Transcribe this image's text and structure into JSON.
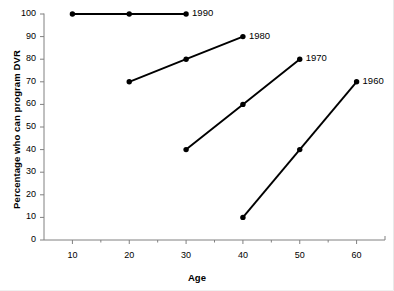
{
  "chart_data": {
    "type": "line",
    "title": "",
    "xlabel": "Age",
    "ylabel": "Percentage who can program DVR",
    "xlim": [
      5,
      65
    ],
    "ylim": [
      0,
      100
    ],
    "xticks": [
      10,
      20,
      30,
      40,
      50,
      60
    ],
    "xtick_labels": [
      "10",
      "20",
      "30",
      "40",
      "50",
      "60"
    ],
    "x_minor_ticks": [
      15,
      25,
      35,
      45,
      55
    ],
    "yticks": [
      0,
      10,
      20,
      30,
      40,
      50,
      60,
      70,
      80,
      90,
      100
    ],
    "ytick_labels": [
      "0",
      "10",
      "20",
      "30",
      "40",
      "50",
      "60",
      "70",
      "80",
      "90",
      "100"
    ],
    "grid": false,
    "legend_position": "inline-right-of-line-end",
    "marker": "filled-circle",
    "line_color": "#000000",
    "series": [
      {
        "name": "1990",
        "label": "1990",
        "x": [
          10,
          20,
          30
        ],
        "values": [
          100,
          100,
          100
        ]
      },
      {
        "name": "1980",
        "label": "1980",
        "x": [
          20,
          30,
          40
        ],
        "values": [
          70,
          80,
          90
        ]
      },
      {
        "name": "1970",
        "label": "1970",
        "x": [
          30,
          40,
          50
        ],
        "values": [
          40,
          60,
          80
        ]
      },
      {
        "name": "1960",
        "label": "1960",
        "x": [
          40,
          50,
          60
        ],
        "values": [
          10,
          40,
          70
        ]
      }
    ]
  }
}
